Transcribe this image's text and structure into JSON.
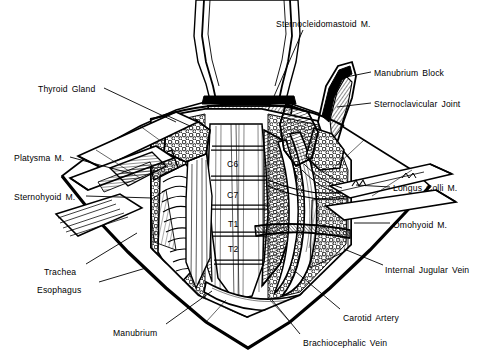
{
  "figure": {
    "background_color": "#ffffff",
    "ink_color": "#000000",
    "width": 491,
    "height": 359
  },
  "labels": [
    {
      "id": "sternocleidomastoid",
      "text": "Sternocleidomastoid M.",
      "x": 276,
      "y": 19,
      "anchor": "start",
      "leader": [
        [
          303,
          30
        ],
        [
          268,
          110
        ]
      ]
    },
    {
      "id": "manubrium-block",
      "text": "Manubrium Block",
      "x": 374,
      "y": 68,
      "anchor": "start",
      "leader": [
        [
          371,
          72
        ],
        [
          341,
          78
        ]
      ]
    },
    {
      "id": "sternoclavicular-joint",
      "text": "Sternoclavicular Joint",
      "x": 374,
      "y": 99,
      "anchor": "start",
      "leader": [
        [
          371,
          103
        ],
        [
          337,
          107
        ]
      ]
    },
    {
      "id": "thyroid-gland",
      "text": "Thyroid Gland",
      "x": 38,
      "y": 84,
      "anchor": "start",
      "leader": [
        [
          104,
          88
        ],
        [
          176,
          122
        ]
      ]
    },
    {
      "id": "platysma",
      "text": "Platysma M.",
      "x": 14,
      "y": 153,
      "anchor": "start",
      "leader": [
        [
          70,
          157
        ],
        [
          133,
          174
        ]
      ]
    },
    {
      "id": "sternohyoid",
      "text": "Sternohyoid M.",
      "x": 14,
      "y": 192,
      "anchor": "start",
      "leader": [
        [
          86,
          196
        ],
        [
          152,
          198
        ]
      ]
    },
    {
      "id": "trachea",
      "text": "Trachea",
      "x": 44,
      "y": 267,
      "anchor": "start",
      "leader": [
        [
          86,
          264
        ],
        [
          137,
          233
        ]
      ]
    },
    {
      "id": "esophagus",
      "text": "Esophagus",
      "x": 37,
      "y": 285,
      "anchor": "start",
      "leader": [
        [
          99,
          282
        ],
        [
          146,
          268
        ]
      ]
    },
    {
      "id": "manubrium",
      "text": "Manubrium",
      "x": 113,
      "y": 328,
      "anchor": "start",
      "leader": [
        [
          166,
          324
        ],
        [
          212,
          291
        ]
      ]
    },
    {
      "id": "longus-colli",
      "text": "Longus Colli M.",
      "x": 393,
      "y": 183,
      "anchor": "start",
      "leader": [
        [
          390,
          187
        ],
        [
          356,
          185
        ]
      ]
    },
    {
      "id": "omohyoid",
      "text": "Omohyoid M.",
      "x": 393,
      "y": 220,
      "anchor": "start",
      "leader": [
        [
          390,
          223
        ],
        [
          354,
          223
        ]
      ]
    },
    {
      "id": "internal-jugular-vein",
      "text": "Internal Jugular Vein",
      "x": 385,
      "y": 265,
      "anchor": "start",
      "leader": [
        [
          383,
          265
        ],
        [
          344,
          249
        ]
      ]
    },
    {
      "id": "carotid-artery",
      "text": "Carotid Artery",
      "x": 343,
      "y": 313,
      "anchor": "start",
      "leader": [
        [
          340,
          309
        ],
        [
          296,
          272
        ]
      ]
    },
    {
      "id": "brachiocephalic-vein",
      "text": "Brachiocephalic Vein",
      "x": 303,
      "y": 338,
      "anchor": "start",
      "leader": [
        [
          300,
          334
        ],
        [
          272,
          300
        ]
      ]
    }
  ],
  "vertebral_levels": [
    {
      "id": "c6",
      "text": "C6",
      "x": 227,
      "y": 159
    },
    {
      "id": "c7",
      "text": "C7",
      "x": 227,
      "y": 190
    },
    {
      "id": "t1",
      "text": "T1",
      "x": 228,
      "y": 219
    },
    {
      "id": "t2",
      "text": "T2",
      "x": 228,
      "y": 244
    }
  ]
}
